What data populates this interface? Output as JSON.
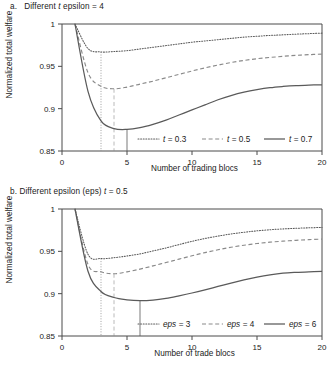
{
  "figure": {
    "width": 333,
    "height": 373,
    "background": "#ffffff",
    "ink_color": "#4a4a4a",
    "text_color": "#1a1a1a"
  },
  "panels": [
    {
      "id": "a",
      "title_prefix": "a.",
      "title": "a.  Different t epsilon = 4",
      "title_plain": "Different",
      "title_italic": "t",
      "title_suffix": "epsilon = 4",
      "xlabel": "Number of trading blocs",
      "ylabel": "Normalized total welfare"
    },
    {
      "id": "b",
      "title_prefix": "b.",
      "title": "b. Different epsilon (eps) t = 0.5",
      "title_plain": "Different epsilon (eps)",
      "title_italic": "t",
      "title_suffix": "= 0.5",
      "xlabel": "Number of trade blocs",
      "ylabel": "Normalized total welfare"
    }
  ],
  "chart_data": [
    {
      "type": "line",
      "panel": "a",
      "title": "a. Different t epsilon = 4",
      "xlabel": "Number of trading blocs",
      "ylabel": "Normalized total welfare",
      "xlim": [
        0,
        20
      ],
      "ylim": [
        0.85,
        1.0
      ],
      "xticks": [
        "0",
        "5",
        "10",
        "15",
        "20"
      ],
      "xtick_values": [
        0,
        5,
        10,
        15,
        20
      ],
      "yticks": [
        "0.85",
        "0.9",
        "0.95",
        "1"
      ],
      "ytick_values": [
        0.85,
        0.9,
        0.95,
        1.0
      ],
      "grid": false,
      "legend_position": "inside-bottom-right",
      "x": [
        1,
        2,
        3,
        4,
        5,
        6,
        7,
        8,
        9,
        10,
        11,
        12,
        13,
        14,
        15,
        16,
        17,
        18,
        19,
        20
      ],
      "series": [
        {
          "name": "t = 0.3",
          "label_plain": "t",
          "label_value": "= 0.3",
          "style": "dotted",
          "color": "#5a5a5a",
          "minimum_x": 3,
          "minimum_y": 0.967,
          "values": [
            1.0,
            0.971,
            0.967,
            0.9675,
            0.9685,
            0.9705,
            0.9725,
            0.9745,
            0.9765,
            0.9785,
            0.98,
            0.9815,
            0.983,
            0.9845,
            0.9855,
            0.9865,
            0.9872,
            0.988,
            0.9886,
            0.9892
          ]
        },
        {
          "name": "t = 0.5",
          "label_plain": "t",
          "label_value": "= 0.5",
          "style": "dashed",
          "color": "#8a8a8a",
          "minimum_x": 4,
          "minimum_y": 0.9235,
          "values": [
            1.0,
            0.9425,
            0.9265,
            0.9235,
            0.9255,
            0.929,
            0.9325,
            0.9365,
            0.9405,
            0.9445,
            0.9482,
            0.9515,
            0.9545,
            0.957,
            0.959,
            0.9605,
            0.9618,
            0.963,
            0.9638,
            0.9645
          ]
        },
        {
          "name": "t = 0.7",
          "label_plain": "t",
          "label_value": "= 0.7",
          "style": "solid",
          "color": "#5a5a5a",
          "minimum_x": 5,
          "minimum_y": 0.8755,
          "values": [
            1.0,
            0.9205,
            0.8855,
            0.8765,
            0.8755,
            0.8775,
            0.8815,
            0.8865,
            0.8925,
            0.8985,
            0.9045,
            0.9105,
            0.9155,
            0.9195,
            0.9225,
            0.9248,
            0.9262,
            0.9272,
            0.9278,
            0.9282
          ]
        }
      ]
    },
    {
      "type": "line",
      "panel": "b",
      "title": "b. Different epsilon (eps) t = 0.5",
      "xlabel": "Number of trade blocs",
      "ylabel": "Normalized total welfare",
      "xlim": [
        0,
        20
      ],
      "ylim": [
        0.85,
        1.0
      ],
      "xticks": [
        "0",
        "5",
        "10",
        "15",
        "20"
      ],
      "xtick_values": [
        0,
        5,
        10,
        15,
        20
      ],
      "yticks": [
        "0.85",
        "0.9",
        "0.95",
        "1"
      ],
      "ytick_values": [
        0.85,
        0.9,
        0.95,
        1.0
      ],
      "grid": false,
      "legend_position": "inside-bottom-right",
      "x": [
        1,
        2,
        3,
        4,
        5,
        6,
        7,
        8,
        9,
        10,
        11,
        12,
        13,
        14,
        15,
        16,
        17,
        18,
        19,
        20
      ],
      "series": [
        {
          "name": "eps = 3",
          "label_plain": "eps",
          "label_value": "= 3",
          "style": "dotted",
          "color": "#5a5a5a",
          "minimum_x": 3,
          "minimum_y": 0.9415,
          "values": [
            1.0,
            0.9465,
            0.9415,
            0.9425,
            0.9445,
            0.947,
            0.9505,
            0.954,
            0.958,
            0.9618,
            0.9652,
            0.968,
            0.9705,
            0.9725,
            0.9742,
            0.9755,
            0.9765,
            0.9772,
            0.9778,
            0.9782
          ]
        },
        {
          "name": "eps = 4",
          "label_plain": "eps",
          "label_value": "= 4",
          "style": "dashed",
          "color": "#8a8a8a",
          "minimum_x": 4,
          "minimum_y": 0.9235,
          "values": [
            1.0,
            0.9345,
            0.9258,
            0.9235,
            0.9258,
            0.929,
            0.9328,
            0.9368,
            0.9408,
            0.9448,
            0.9485,
            0.9518,
            0.9548,
            0.9572,
            0.9592,
            0.9608,
            0.962,
            0.963,
            0.9638,
            0.9645
          ]
        },
        {
          "name": "eps = 6",
          "label_plain": "eps",
          "label_value": "= 6",
          "style": "solid",
          "color": "#5a5a5a",
          "minimum_x": 6,
          "minimum_y": 0.8918,
          "values": [
            1.0,
            0.9265,
            0.9025,
            0.8955,
            0.8928,
            0.8918,
            0.8925,
            0.8945,
            0.8975,
            0.9008,
            0.9045,
            0.9085,
            0.9125,
            0.9162,
            0.9195,
            0.9222,
            0.9242,
            0.9252,
            0.9258,
            0.9262
          ]
        }
      ]
    }
  ]
}
